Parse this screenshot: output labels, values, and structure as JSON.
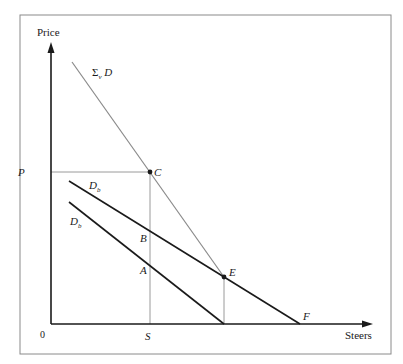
{
  "diagram": {
    "title": "",
    "axes": {
      "y_label": "Price",
      "x_label": "Steers",
      "origin_label": "0",
      "p_label": "P",
      "s_label": "S"
    },
    "curves": [
      {
        "id": "sum-demand",
        "label_main": "Σ",
        "label_sub": "v",
        "label_tail": " D",
        "x1": 72,
        "y1": 62,
        "x2": 224,
        "y2": 277,
        "color": "#8a8a8a",
        "width": 1.2
      },
      {
        "id": "demand-b-upper",
        "label_main": "D",
        "label_sub": "b",
        "x1": 69,
        "y1": 181,
        "x2": 300,
        "y2": 324,
        "color": "#1a1a1a",
        "width": 1.6
      },
      {
        "id": "demand-b-lower",
        "label_main": "D",
        "label_sub": "b",
        "x1": 69,
        "y1": 202,
        "x2": 224,
        "y2": 324,
        "color": "#1a1a1a",
        "width": 1.6
      }
    ],
    "points": [
      {
        "id": "C",
        "label": "C",
        "x": 150,
        "y": 172,
        "dot": true
      },
      {
        "id": "E",
        "label": "E",
        "x": 224,
        "y": 277,
        "dot": true
      },
      {
        "id": "B",
        "label": "B",
        "x": 150,
        "y": 0,
        "dot": false
      },
      {
        "id": "A",
        "label": "A",
        "x": 150,
        "y": 0,
        "dot": false
      },
      {
        "id": "F",
        "label": "F",
        "x": 300,
        "y": 324,
        "dot": false
      }
    ],
    "colors": {
      "axis": "#1a1a1a",
      "guide": "#9a9a9a",
      "frame": "#8a8a8a"
    }
  }
}
